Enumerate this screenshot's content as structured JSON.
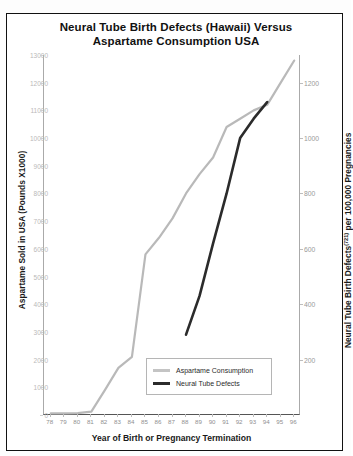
{
  "chart_data": {
    "type": "line",
    "title": "Neural Tube Birth Defects (Hawaii) Versus Aspartame Consumption USA",
    "title_line1": "Neural Tube Birth Defects (Hawaii) Versus",
    "title_line2": "Aspartame Consumption USA",
    "xlabel": "Year of Birth or Pregnancy Termination",
    "ylabel_left": "Aspartame Sold in USA (Pounds X1000)",
    "ylabel_right_main": "Neural Tube Birth Defects",
    "ylabel_right_sup": "(721)",
    "ylabel_right_tail": " per 100,000 Pregnancies",
    "grid": false,
    "legend_position": "inside-bottom-right",
    "x": [
      78,
      79,
      80,
      81,
      82,
      83,
      84,
      85,
      86,
      87,
      88,
      89,
      90,
      91,
      92,
      93,
      94,
      95,
      96
    ],
    "xticklabels": [
      "78",
      "79",
      "80",
      "81",
      "82",
      "83",
      "84",
      "85",
      "86",
      "87",
      "88",
      "89",
      "90",
      "91",
      "92",
      "93",
      "94",
      "95",
      "96"
    ],
    "xlim": [
      77.5,
      96.5
    ],
    "ylim_left": [
      0,
      13000
    ],
    "ylim_right": [
      0,
      1300
    ],
    "yticks_left": [
      0,
      1000,
      2000,
      3000,
      4000,
      5000,
      6000,
      7000,
      8000,
      9000,
      10000,
      11000,
      12000,
      13000
    ],
    "yticklabels_left": [
      "0",
      "1000",
      "2000",
      "3000",
      "4000",
      "5000",
      "6000",
      "7000",
      "8000",
      "9000",
      "10000",
      "11000",
      "12000",
      "13000"
    ],
    "yticks_right": [
      200,
      400,
      600,
      800,
      1000,
      1200
    ],
    "yticklabels_right": [
      "200",
      "400",
      "600",
      "800",
      "1000",
      "1200"
    ],
    "series": [
      {
        "name": "Aspartame Consumption",
        "axis": "left",
        "color": "#b9b9b9",
        "x": [
          78,
          79,
          80,
          81,
          82,
          83,
          84,
          85,
          86,
          87,
          88,
          89,
          90,
          91,
          92,
          93,
          94,
          95,
          96
        ],
        "values": [
          60,
          60,
          70,
          120,
          900,
          1700,
          2100,
          5800,
          6400,
          7100,
          8000,
          8700,
          9300,
          10400,
          10700,
          11000,
          11200,
          12000,
          12800
        ]
      },
      {
        "name": "Neural Tube Defects",
        "axis": "right",
        "color": "#2b2b2b",
        "x": [
          88,
          89,
          90,
          91,
          92,
          93,
          94
        ],
        "values": [
          290,
          430,
          620,
          800,
          1000,
          1070,
          1130
        ]
      }
    ],
    "legend": [
      {
        "label": "Aspartame Consumption",
        "color": "#c4c4c4"
      },
      {
        "label": "Neural Tube Defects",
        "color": "#2b2b2b"
      }
    ]
  }
}
